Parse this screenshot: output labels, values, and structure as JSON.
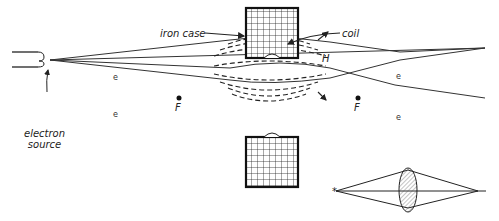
{
  "diagram": {
    "labels": {
      "iron_case": "iron case",
      "coil": "coil",
      "electron_source_line1": "electron",
      "electron_source_line2": "source",
      "field": "H",
      "focus_left": "F",
      "focus_right": "F",
      "electron": "e"
    },
    "inset": {
      "description": "Optical analogy: converging glass lens focusing rays from a point source"
    },
    "colors": {
      "ink": "#222222",
      "electron": "#666666",
      "background": "#ffffff"
    }
  }
}
